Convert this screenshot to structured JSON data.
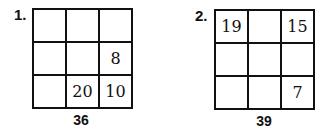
{
  "puzzles": [
    {
      "number": "1.",
      "cells": [
        "",
        "",
        "",
        "",
        "",
        "8",
        "",
        "20",
        "10"
      ],
      "total": "36"
    },
    {
      "number": "2.",
      "cells": [
        "19",
        "",
        "15",
        "",
        "",
        "",
        "",
        "",
        "7"
      ],
      "total": "39"
    }
  ]
}
